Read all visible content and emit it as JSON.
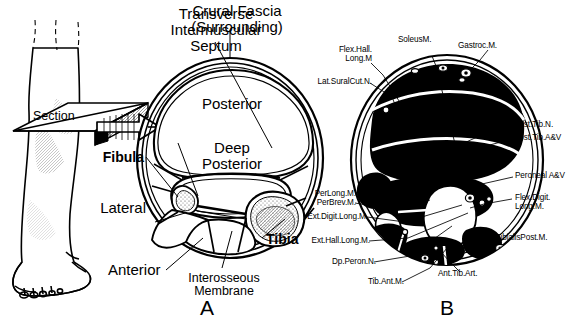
{
  "figure": {
    "background_color": "#ffffff",
    "line_color": "#000000",
    "fill_color": "#000000"
  },
  "orientation_drawing": {
    "name": "lower-leg-with-section-plane",
    "section_label": "Section"
  },
  "panel_a": {
    "letter": "A",
    "description": "Schematic cross-section showing fascial compartments",
    "callouts": [
      {
        "id": "transverse-septum",
        "text": "Transverse\nIntermuscular\nSeptum",
        "align": "center"
      },
      {
        "id": "crural-fascia",
        "text": "Crural Fascia\n(Surrounding)",
        "align": "center"
      },
      {
        "id": "posterior",
        "text": "Posterior",
        "align": "center"
      },
      {
        "id": "deep-posterior",
        "text": "Deep\nPosterior",
        "align": "center"
      },
      {
        "id": "fibula",
        "text": "Fibula",
        "align": "right",
        "bold": true
      },
      {
        "id": "lateral",
        "text": "Lateral",
        "align": "right"
      },
      {
        "id": "anterior",
        "text": "Anterior",
        "align": "center"
      },
      {
        "id": "interosseous-membrane",
        "text": "Interosseous\nMembrane",
        "align": "center"
      },
      {
        "id": "tibia",
        "text": "Tibia",
        "align": "left",
        "bold": true
      }
    ]
  },
  "panel_b": {
    "letter": "B",
    "description": "Detailed anatomical cross-section with muscles, nerves and vessels",
    "callouts_left": [
      {
        "id": "flex-hall-long-m",
        "text": "Flex.Hall.\nLong.M"
      },
      {
        "id": "lat-sural-cut-n",
        "text": "Lat.SuralCut.N."
      },
      {
        "id": "soleus-m",
        "text": "SoleusM."
      },
      {
        "id": "gastroc-m",
        "text": "Gastroc.M."
      },
      {
        "id": "per-long-m",
        "text": "PerLong.M."
      },
      {
        "id": "per-brev-m",
        "text": "PerBrev.M."
      },
      {
        "id": "ext-digit-long-m",
        "text": "Ext.Digit.Long.M."
      },
      {
        "id": "ext-hall-long-m",
        "text": "Ext.Hall.Long.M."
      },
      {
        "id": "dp-peron-n",
        "text": "Dp.Peron.N."
      },
      {
        "id": "tib-ant-m",
        "text": "Tib.Ant.M."
      }
    ],
    "callouts_right": [
      {
        "id": "post-tib-n",
        "text": "Post.Tib.N."
      },
      {
        "id": "post-tib-av",
        "text": "Post.Tib.A&V"
      },
      {
        "id": "peroneal-av",
        "text": "Peroneal A&V"
      },
      {
        "id": "flex-digit-long-m",
        "text": "Flex.Digit.\nLong.M."
      },
      {
        "id": "tibialis-post-m",
        "text": "TibialisPost.M."
      },
      {
        "id": "ant-tib-art",
        "text": "Ant.Tib.Art."
      }
    ]
  }
}
